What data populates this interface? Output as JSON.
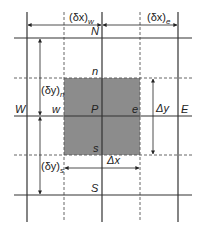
{
  "diagram": {
    "nodes": {
      "N": "N",
      "S": "S",
      "W": "W",
      "E": "E",
      "P": "P"
    },
    "faces": {
      "n": "n",
      "s": "s",
      "w": "w",
      "e": "e"
    },
    "dimensions": {
      "dx_w": "(δx)",
      "dx_w_sub": "w",
      "dx_e": "(δx)",
      "dx_e_sub": "e",
      "dy_n": "(δy)",
      "dy_n_sub": "n",
      "dy_s": "(δy)",
      "dy_s_sub": "s",
      "delta_x": "Δx",
      "delta_y": "Δy"
    },
    "colors": {
      "grid_line": "#333333",
      "control_volume_fill": "#8c8c8c",
      "dashed_line": "#555555"
    }
  }
}
